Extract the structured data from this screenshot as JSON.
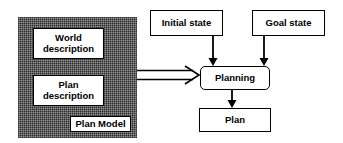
{
  "diagram": {
    "type": "flowchart",
    "canvas": {
      "width": 343,
      "height": 143,
      "background": "#ffffff"
    },
    "colors": {
      "stroke": "#000000",
      "box_fill": "#ffffff",
      "container_fill": "#2b2b2b",
      "text": "#000000"
    },
    "container": {
      "name": "Plan Model",
      "tag_label": "Plan Model",
      "fill_style": "dithered-dark"
    },
    "nodes": [
      {
        "id": "world-description",
        "label": "World\ndescription",
        "shape": "rectangle",
        "inside_container": true
      },
      {
        "id": "plan-description",
        "label": "Plan\ndescription",
        "shape": "rectangle",
        "inside_container": true
      },
      {
        "id": "plan-model-tag",
        "label": "Plan Model",
        "shape": "rectangle",
        "inside_container": true
      },
      {
        "id": "initial-state",
        "label": "Initial state",
        "shape": "rectangle",
        "inside_container": false
      },
      {
        "id": "goal-state",
        "label": "Goal state",
        "shape": "rectangle",
        "inside_container": false
      },
      {
        "id": "planning",
        "label": "Planning",
        "shape": "rounded-rectangle",
        "inside_container": false
      },
      {
        "id": "plan",
        "label": "Plan",
        "shape": "rectangle",
        "inside_container": false
      }
    ],
    "edges": [
      {
        "from": "plan-model-container",
        "to": "planning",
        "style": "hollow-arrow",
        "direction": "right"
      },
      {
        "from": "initial-state",
        "to": "planning",
        "style": "solid-arrow",
        "direction": "down"
      },
      {
        "from": "goal-state",
        "to": "planning",
        "style": "solid-arrow",
        "direction": "down"
      },
      {
        "from": "planning",
        "to": "plan",
        "style": "solid-arrow",
        "direction": "down"
      }
    ]
  }
}
